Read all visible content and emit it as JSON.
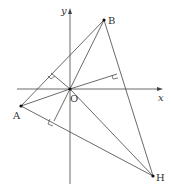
{
  "diagram": {
    "title": "",
    "axes": {
      "x_label": "x",
      "y_label": "y",
      "origin_label": "O"
    },
    "points": {
      "A": {
        "label": "A"
      },
      "B": {
        "label": "B"
      },
      "H": {
        "label": "H"
      },
      "O": {
        "label": "O"
      }
    },
    "segments": [
      "AB",
      "BH",
      "AH",
      "AO",
      "BO",
      "OH",
      "O-foot-AB",
      "O-foot-AH",
      "O-foot-BH"
    ],
    "right_angle_marks": 3,
    "colors": {
      "line": "#444444",
      "point": "#111111",
      "background": "#ffffff"
    }
  }
}
